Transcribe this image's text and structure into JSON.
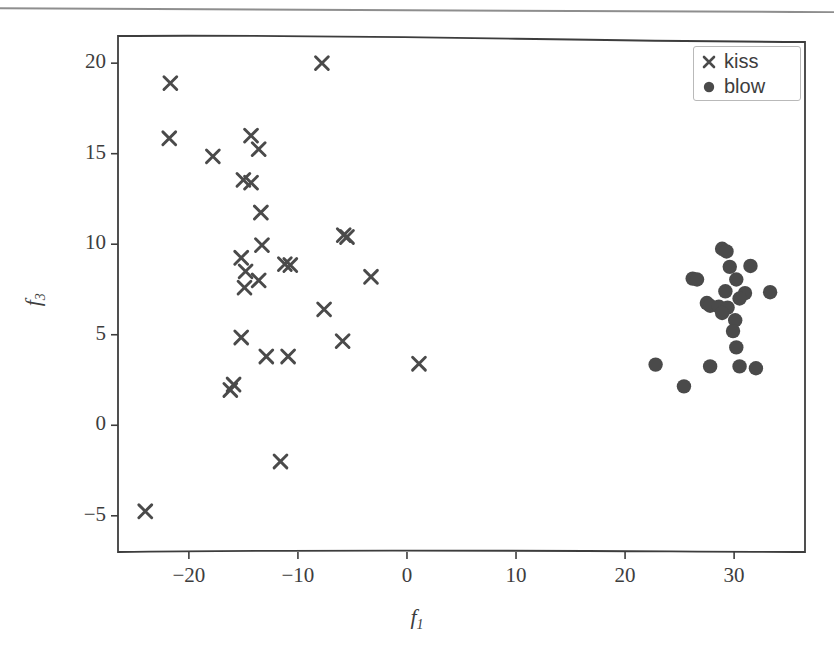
{
  "figure": {
    "background": "#ffffff",
    "marker_color": "#4a4a4a",
    "axis_color": "#3d3d3d",
    "page_rule": true
  },
  "legend": {
    "position": "upper-right",
    "entries": [
      {
        "label": "kiss",
        "marker": "x-marker-icon",
        "marker_type": "x"
      },
      {
        "label": "blow",
        "marker": "circle-marker-icon",
        "marker_type": "circle"
      }
    ]
  },
  "chart_data": {
    "type": "scatter",
    "title": "",
    "xlabel": "f_1",
    "ylabel": "f_3",
    "xlabel_base": "f",
    "xlabel_sub": "1",
    "ylabel_base": "f",
    "ylabel_sub": "3",
    "xlim": [
      -26.5,
      36.5
    ],
    "ylim": [
      -7.0,
      21.5
    ],
    "xticks": [
      -20,
      -10,
      0,
      10,
      20,
      30
    ],
    "xtick_labels": [
      "−20",
      "−10",
      "0",
      "10",
      "20",
      "30"
    ],
    "yticks": [
      20,
      15,
      10,
      5,
      0,
      -5
    ],
    "ytick_labels": [
      "20",
      "15",
      "10",
      "5",
      "0",
      "−5"
    ],
    "grid": false,
    "legend_position": "upper right",
    "series": [
      {
        "name": "kiss",
        "marker": "x",
        "color": "#4a4a4a",
        "points": [
          [
            -7.8,
            20.0
          ],
          [
            -21.7,
            18.9
          ],
          [
            -21.8,
            15.85
          ],
          [
            -17.8,
            14.85
          ],
          [
            -14.3,
            16.0
          ],
          [
            -13.6,
            15.25
          ],
          [
            -15.0,
            13.55
          ],
          [
            -14.3,
            13.4
          ],
          [
            -13.4,
            11.75
          ],
          [
            -5.8,
            10.5
          ],
          [
            -5.5,
            10.4
          ],
          [
            -13.3,
            9.95
          ],
          [
            -15.2,
            9.25
          ],
          [
            -11.2,
            8.9
          ],
          [
            -10.7,
            8.85
          ],
          [
            -3.3,
            8.2
          ],
          [
            -14.8,
            8.5
          ],
          [
            -13.6,
            8.0
          ],
          [
            -14.9,
            7.6
          ],
          [
            -7.6,
            6.4
          ],
          [
            -15.2,
            4.85
          ],
          [
            -5.9,
            4.65
          ],
          [
            -12.9,
            3.8
          ],
          [
            -10.9,
            3.8
          ],
          [
            1.1,
            3.4
          ],
          [
            -15.9,
            2.25
          ],
          [
            -16.2,
            1.95
          ],
          [
            -11.6,
            -2.0
          ],
          [
            -24.0,
            -4.75
          ]
        ]
      },
      {
        "name": "blow",
        "marker": "o",
        "color": "#4a4a4a",
        "points": [
          [
            28.9,
            9.75
          ],
          [
            29.3,
            9.6
          ],
          [
            29.6,
            8.75
          ],
          [
            31.5,
            8.8
          ],
          [
            26.2,
            8.1
          ],
          [
            26.6,
            8.05
          ],
          [
            30.2,
            8.05
          ],
          [
            29.2,
            7.4
          ],
          [
            31.0,
            7.3
          ],
          [
            33.3,
            7.35
          ],
          [
            27.5,
            6.75
          ],
          [
            27.8,
            6.6
          ],
          [
            28.6,
            6.55
          ],
          [
            29.4,
            6.5
          ],
          [
            30.5,
            7.0
          ],
          [
            28.9,
            6.2
          ],
          [
            30.1,
            5.8
          ],
          [
            29.9,
            5.2
          ],
          [
            30.2,
            4.3
          ],
          [
            22.8,
            3.35
          ],
          [
            27.8,
            3.25
          ],
          [
            30.5,
            3.25
          ],
          [
            32.0,
            3.15
          ],
          [
            25.4,
            2.15
          ]
        ]
      }
    ]
  }
}
